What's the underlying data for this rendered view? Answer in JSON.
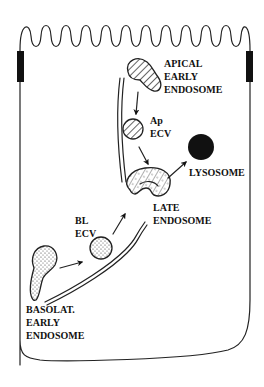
{
  "diagram": {
    "labels": {
      "apical_early_endosome": [
        "APICAL",
        "EARLY",
        "ENDOSOME"
      ],
      "ap_ecv": [
        "Ap",
        "ECV"
      ],
      "lysosome": "LYSOSOME",
      "late_endosome": [
        "LATE",
        "ENDOSOME"
      ],
      "bl_ecv": [
        "BL",
        "ECV"
      ],
      "basolateral_early_endosome": [
        "BASOLAT.",
        "EARLY",
        "ENDOSOME"
      ]
    },
    "nodes": [
      {
        "id": "apical_early_endosome",
        "fill": "hatched"
      },
      {
        "id": "ap_ecv",
        "fill": "hatched"
      },
      {
        "id": "late_endosome",
        "fill": "crosshatched-dotted"
      },
      {
        "id": "lysosome",
        "fill": "solid-black"
      },
      {
        "id": "bl_ecv",
        "fill": "dotted"
      },
      {
        "id": "basolateral_early_endosome",
        "fill": "dotted"
      }
    ],
    "edges": [
      {
        "from": "apical_early_endosome",
        "to": "ap_ecv"
      },
      {
        "from": "ap_ecv",
        "to": "late_endosome"
      },
      {
        "from": "late_endosome",
        "to": "lysosome"
      },
      {
        "from": "basolateral_early_endosome",
        "to": "bl_ecv"
      },
      {
        "from": "bl_ecv",
        "to": "late_endosome"
      }
    ],
    "colors": {
      "ink": "#111111",
      "background": "#ffffff"
    }
  }
}
